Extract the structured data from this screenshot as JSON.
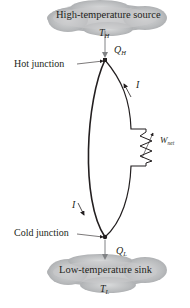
{
  "source": {
    "title": "High-temperature source",
    "temp_symbol": "T",
    "temp_subscript": "H"
  },
  "sink": {
    "title": "Low-temperature sink",
    "temp_symbol": "T",
    "temp_subscript": "L"
  },
  "heat_in": {
    "symbol": "Q",
    "subscript": "H"
  },
  "heat_out": {
    "symbol": "Q",
    "subscript": "L"
  },
  "hot_junction": {
    "label": "Hot junction"
  },
  "cold_junction": {
    "label": "Cold junction"
  },
  "current": {
    "right_label": "I",
    "left_label": "I"
  },
  "work": {
    "symbol": "W",
    "subscript": "net"
  },
  "colors": {
    "cloud_fill": "#a7a9ac",
    "wire": "#231f20",
    "arrow": "#808285"
  }
}
